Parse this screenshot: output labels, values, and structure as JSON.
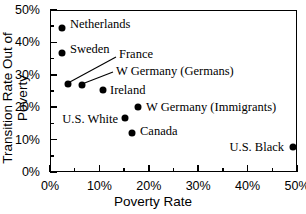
{
  "chart_data": {
    "type": "scatter",
    "title": "",
    "xlabel": "Poverty Rate",
    "ylabel": "Transition Rate Out of Poverty",
    "xlim": [
      0,
      50
    ],
    "ylim": [
      0,
      50
    ],
    "grid": false,
    "legend": "none",
    "xticks": [
      "0%",
      "10%",
      "20%",
      "30%",
      "40%",
      "50%"
    ],
    "xtick_values": [
      0,
      10,
      20,
      30,
      40,
      50
    ],
    "yticks": [
      "0%",
      "10%",
      "20%",
      "30%",
      "40%",
      "50%"
    ],
    "ytick_values": [
      0,
      10,
      20,
      30,
      40,
      50
    ],
    "points": [
      {
        "label": "Netherlands",
        "x": 2.4,
        "y": 44.3,
        "label_side": "right"
      },
      {
        "label": "Sweden",
        "x": 2.5,
        "y": 36.6,
        "label_side": "right"
      },
      {
        "label": "France",
        "x": 3.6,
        "y": 27.3,
        "label_side": "leader"
      },
      {
        "label": "W Germany (Germans)",
        "x": 6.5,
        "y": 26.8,
        "label_side": "leader"
      },
      {
        "label": "Ireland",
        "x": 10.8,
        "y": 25.2,
        "label_side": "right"
      },
      {
        "label": "W Germany (Immigrants)",
        "x": 17.8,
        "y": 20.0,
        "label_side": "right"
      },
      {
        "label": "U.S. White",
        "x": 15.2,
        "y": 16.8,
        "label_side": "left"
      },
      {
        "label": "Canada",
        "x": 16.6,
        "y": 12.0,
        "label_side": "right"
      },
      {
        "label": "U.S. Black",
        "x": 49.2,
        "y": 7.7,
        "label_side": "left"
      }
    ]
  }
}
